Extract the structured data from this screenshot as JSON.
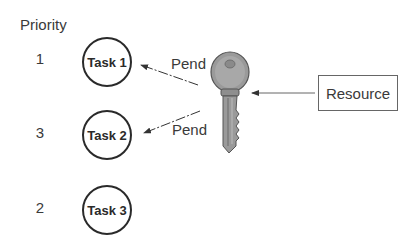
{
  "diagram": {
    "priority_header": "Priority",
    "tasks": [
      {
        "label": "Task 1",
        "priority": "1"
      },
      {
        "label": "Task 2",
        "priority": "3"
      },
      {
        "label": "Task 3",
        "priority": "2"
      }
    ],
    "edges": [
      {
        "label": "Pend",
        "from": "Task 1",
        "to": "Key"
      },
      {
        "label": "Pend",
        "from": "Task 2",
        "to": "Key"
      }
    ],
    "resource": {
      "label": "Resource"
    },
    "key_icon": "key-icon",
    "colors": {
      "line": "#333333",
      "key_fill": "#9a9a9a",
      "key_dark": "#6a6a6a"
    }
  }
}
